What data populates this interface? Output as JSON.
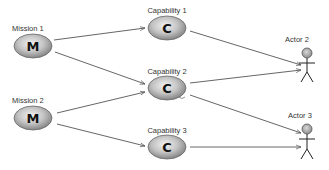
{
  "diagram": {
    "type": "mission-capability-actor",
    "missions": [
      {
        "id": "mission1",
        "label": "Mission 1",
        "letter": "M",
        "cx": 33,
        "cy": 46
      },
      {
        "id": "mission2",
        "label": "Mission 2",
        "letter": "M",
        "cx": 33,
        "cy": 118
      }
    ],
    "capabilities": [
      {
        "id": "cap1",
        "label": "Capability 1",
        "letter": "C",
        "cx": 167,
        "cy": 28
      },
      {
        "id": "cap2",
        "label": "Capability 2",
        "letter": "C",
        "cx": 167,
        "cy": 88
      },
      {
        "id": "cap3",
        "label": "Capability 3",
        "letter": "C",
        "cx": 167,
        "cy": 147
      }
    ],
    "actors": [
      {
        "id": "actor2",
        "label": "Actor 2"
      },
      {
        "id": "actor3",
        "label": "Actor 3"
      }
    ],
    "edges": [
      {
        "from": "Mission 1",
        "to": "Capability 1"
      },
      {
        "from": "Mission 1",
        "to": "Capability 2"
      },
      {
        "from": "Mission 2",
        "to": "Capability 2"
      },
      {
        "from": "Mission 2",
        "to": "Capability 3"
      },
      {
        "from": "Capability 1",
        "to": "Actor 2"
      },
      {
        "from": "Capability 2",
        "to": "Actor 2"
      },
      {
        "from": "Capability 2",
        "to": "Actor 3"
      },
      {
        "from": "Capability 3",
        "to": "Actor 3"
      }
    ],
    "colors": {
      "node_fill_light": "#e8e8e8",
      "node_fill_dark": "#8a8a8a",
      "node_stroke": "#6a6a6a",
      "edge": "#555555",
      "label": "#333333"
    }
  }
}
